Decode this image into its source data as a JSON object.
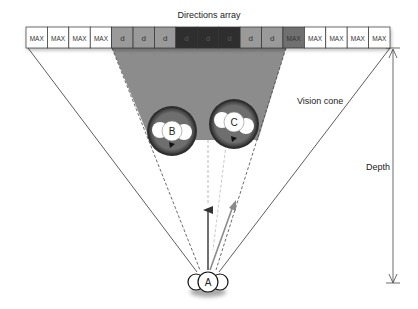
{
  "title": "Directions array",
  "array": {
    "cells": [
      {
        "label": "MAX",
        "shade": "#ffffff",
        "text_color": "#333333"
      },
      {
        "label": "MAX",
        "shade": "#ffffff",
        "text_color": "#333333"
      },
      {
        "label": "MAX",
        "shade": "#ffffff",
        "text_color": "#333333"
      },
      {
        "label": "MAX",
        "shade": "#ffffff",
        "text_color": "#333333"
      },
      {
        "label": "d",
        "shade": "#9a9a9a",
        "text_color": "#333333"
      },
      {
        "label": "d",
        "shade": "#9a9a9a",
        "text_color": "#333333"
      },
      {
        "label": "d",
        "shade": "#9a9a9a",
        "text_color": "#333333"
      },
      {
        "label": "d",
        "shade": "#2e2e2e",
        "text_color": "#555555"
      },
      {
        "label": "d",
        "shade": "#2e2e2e",
        "text_color": "#555555"
      },
      {
        "label": "d",
        "shade": "#2e2e2e",
        "text_color": "#555555"
      },
      {
        "label": "d",
        "shade": "#9a9a9a",
        "text_color": "#333333"
      },
      {
        "label": "d",
        "shade": "#9a9a9a",
        "text_color": "#333333"
      },
      {
        "label": "MAX",
        "shade": "#707070",
        "text_color": "#333333"
      },
      {
        "label": "MAX",
        "shade": "#ffffff",
        "text_color": "#333333"
      },
      {
        "label": "MAX",
        "shade": "#ffffff",
        "text_color": "#333333"
      },
      {
        "label": "MAX",
        "shade": "#ffffff",
        "text_color": "#333333"
      },
      {
        "label": "MAX",
        "shade": "#ffffff",
        "text_color": "#333333"
      }
    ]
  },
  "labels": {
    "vision_cone": "Vision cone",
    "depth": "Depth"
  },
  "agents": {
    "a": "A",
    "b": "B",
    "c": "C"
  },
  "colors": {
    "shadow_region": "#8c8c8c",
    "obstacle_fill": "#6e6e6e",
    "agent_fill": "#ffffff",
    "line": "#333333",
    "arrow_dark": "#333333",
    "arrow_light": "#8a8a8a"
  }
}
